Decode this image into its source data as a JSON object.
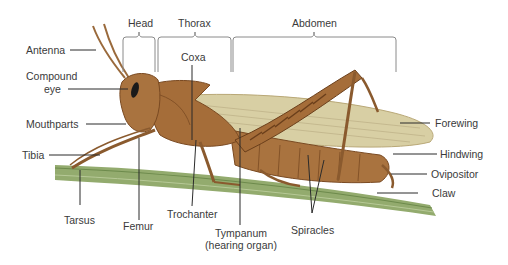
{
  "diagram": {
    "regions": [
      {
        "id": "head",
        "label": "Head"
      },
      {
        "id": "thorax",
        "label": "Thorax"
      },
      {
        "id": "abdomen",
        "label": "Abdomen"
      }
    ],
    "labels": {
      "antenna": "Antenna",
      "compound_eye_1": "Compound",
      "compound_eye_2": "eye",
      "mouthparts": "Mouthparts",
      "tibia": "Tibia",
      "tarsus": "Tarsus",
      "femur": "Femur",
      "coxa": "Coxa",
      "trochanter": "Trochanter",
      "tympanum_1": "Tympanum",
      "tympanum_2": "(hearing organ)",
      "spiracles": "Spiracles",
      "forewing": "Forewing",
      "hindwing": "Hindwing",
      "ovipositor": "Ovipositor",
      "claw": "Claw"
    },
    "colors": {
      "body": "#a9733f",
      "body_dark": "#7a4a22",
      "wing": "#d9cfa6",
      "stem": "#8fa86a",
      "stem_dark": "#6d8a4c",
      "leader": "#2b2b2b",
      "bracket": "#8a8a8a",
      "text": "#3a3a3a"
    }
  }
}
